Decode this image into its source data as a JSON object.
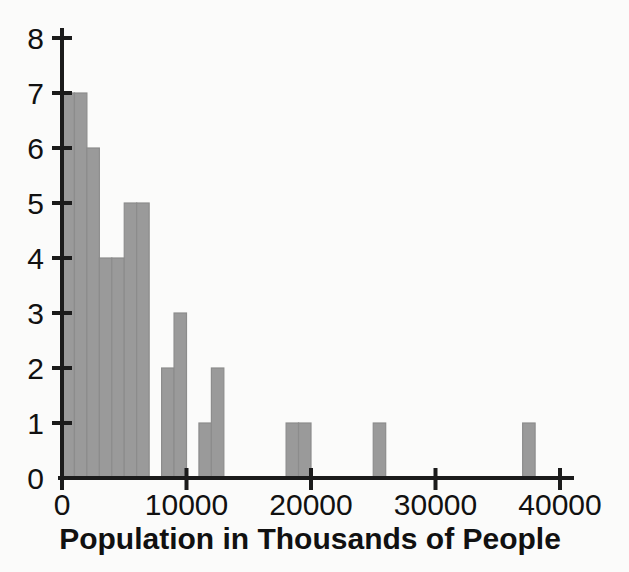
{
  "chart_data": {
    "type": "bar",
    "title": "",
    "subtitle": "",
    "xlabel": "Population in Thousands of People",
    "ylabel": "",
    "xlim": [
      -1000,
      41000
    ],
    "ylim": [
      0,
      8
    ],
    "grid": false,
    "legend": null,
    "bin_width": 1000,
    "xticks": [
      0,
      10000,
      20000,
      30000,
      40000
    ],
    "xtick_labels": [
      "0",
      "10000",
      "20000",
      "30000",
      "40000"
    ],
    "yticks": [
      0,
      1,
      2,
      3,
      4,
      5,
      6,
      7,
      8
    ],
    "ytick_labels": [
      "0",
      "1",
      "2",
      "3",
      "4",
      "5",
      "6",
      "7",
      "8"
    ],
    "bar_color": "#9a9a9a",
    "bar_edge_color": "#8c8c8c",
    "axis_color": "#1b1b1b",
    "background_color": "#fbfbfa",
    "bins": [
      {
        "start": 0,
        "end": 1000,
        "value": 7
      },
      {
        "start": 1000,
        "end": 2000,
        "value": 7
      },
      {
        "start": 2000,
        "end": 3000,
        "value": 6
      },
      {
        "start": 3000,
        "end": 4000,
        "value": 4
      },
      {
        "start": 4000,
        "end": 5000,
        "value": 4
      },
      {
        "start": 5000,
        "end": 6000,
        "value": 5
      },
      {
        "start": 6000,
        "end": 7000,
        "value": 5
      },
      {
        "start": 7000,
        "end": 8000,
        "value": 0
      },
      {
        "start": 8000,
        "end": 9000,
        "value": 2
      },
      {
        "start": 9000,
        "end": 10000,
        "value": 3
      },
      {
        "start": 10000,
        "end": 11000,
        "value": 0
      },
      {
        "start": 11000,
        "end": 12000,
        "value": 1
      },
      {
        "start": 12000,
        "end": 13000,
        "value": 2
      },
      {
        "start": 13000,
        "end": 18000,
        "value": 0
      },
      {
        "start": 18000,
        "end": 19000,
        "value": 1
      },
      {
        "start": 19000,
        "end": 20000,
        "value": 1
      },
      {
        "start": 20000,
        "end": 25000,
        "value": 0
      },
      {
        "start": 25000,
        "end": 26000,
        "value": 1
      },
      {
        "start": 26000,
        "end": 37000,
        "value": 0
      },
      {
        "start": 37000,
        "end": 38000,
        "value": 1
      }
    ],
    "categories": [
      "0-1000",
      "1000-2000",
      "2000-3000",
      "3000-4000",
      "4000-5000",
      "5000-6000",
      "6000-7000",
      "7000-8000",
      "8000-9000",
      "9000-10000",
      "10000-11000",
      "11000-12000",
      "12000-13000",
      "13000-18000",
      "18000-19000",
      "19000-20000",
      "20000-25000",
      "25000-26000",
      "26000-37000",
      "37000-38000"
    ],
    "values": [
      7,
      7,
      6,
      4,
      4,
      5,
      5,
      0,
      2,
      3,
      0,
      1,
      2,
      0,
      1,
      1,
      0,
      1,
      0,
      1
    ]
  }
}
